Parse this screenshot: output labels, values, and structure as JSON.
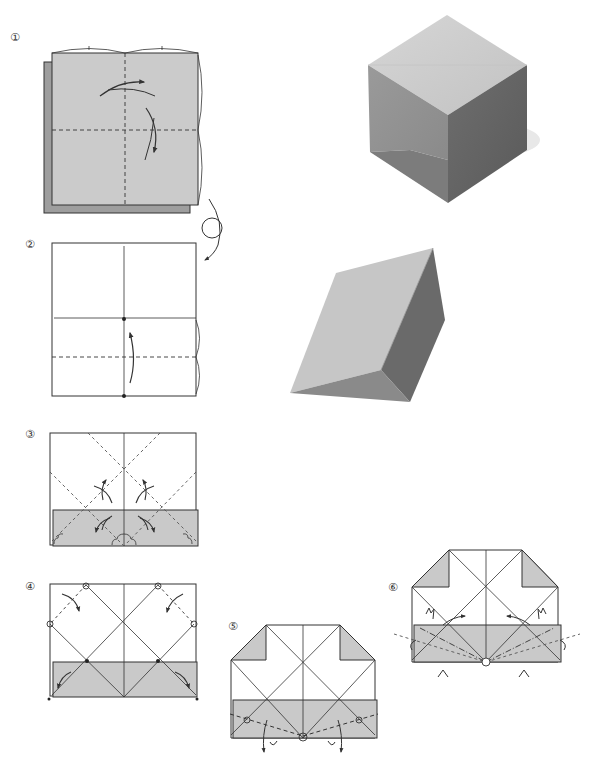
{
  "page": {
    "colors": {
      "paper_gray": "#c9c9c9",
      "back_gray": "#9e9e9e",
      "line": "#333333",
      "background": "#ffffff"
    }
  },
  "steps": [
    {
      "number": "①",
      "label": "Step 1",
      "description": "Colored square, fold in half both ways and unfold (valley folds)"
    },
    {
      "number": "②",
      "label": "Step 2",
      "description": "Turn over; fold bottom edge to center line"
    },
    {
      "number": "③",
      "label": "Step 3",
      "description": "Crease diagonals and unfold"
    },
    {
      "number": "④",
      "label": "Step 4",
      "description": "Fold top corners down along marked points"
    },
    {
      "number": "⑤",
      "label": "Step 5",
      "description": "Fold band along dash line at circled points, behind"
    },
    {
      "number": "⑥",
      "label": "Step 6",
      "description": "Fold and tuck flaps; form 3D shape"
    }
  ],
  "photos": [
    {
      "name": "finished-cube",
      "description": "Finished origami cube"
    },
    {
      "name": "finished-prism",
      "description": "Finished triangular prism"
    }
  ],
  "symbols": {
    "turn_over": "turn-over-icon",
    "valley_fold": "dashed-line",
    "mountain_fold": "dash-dot-line",
    "fold_arrow": "curved-arrow-icon",
    "point_mark": "circle-point-icon"
  }
}
